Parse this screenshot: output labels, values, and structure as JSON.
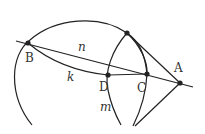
{
  "diagram": {
    "stroke_color": "#222222",
    "points": [
      {
        "id": "B",
        "label": "B"
      },
      {
        "id": "A",
        "label": "A"
      },
      {
        "id": "D",
        "label": "D"
      },
      {
        "id": "C",
        "label": "C"
      },
      {
        "id": "T",
        "label": ""
      }
    ],
    "curve_labels": {
      "n": "n",
      "k": "k",
      "m": "m"
    }
  }
}
